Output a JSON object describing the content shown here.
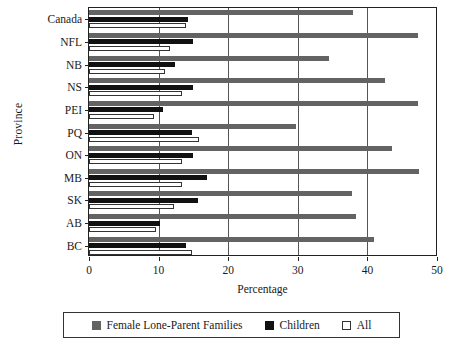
{
  "chart_data": {
    "type": "bar",
    "orientation": "horizontal",
    "title": "",
    "xlabel": "Percentage",
    "ylabel": "Province",
    "xlim": [
      0,
      50
    ],
    "xticks": [
      0,
      10,
      20,
      30,
      40,
      50
    ],
    "xticklabels": [
      "0",
      "10",
      "20",
      "30",
      "40",
      "50"
    ],
    "grid": true,
    "grid_axis": "x",
    "legend_position": "below",
    "categories": [
      "Canada",
      "NFL",
      "NB",
      "NS",
      "PEI",
      "PQ",
      "ON",
      "MB",
      "SK",
      "AB",
      "BC"
    ],
    "series": [
      {
        "name": "Female Lone-Parent Families",
        "color": "#636363",
        "values": [
          38.0,
          47.3,
          34.5,
          42.5,
          47.3,
          29.8,
          43.5,
          47.4,
          37.8,
          38.4,
          41.0
        ]
      },
      {
        "name": "Children",
        "color": "#111111",
        "values": [
          14.2,
          15.0,
          12.3,
          15.0,
          10.6,
          14.8,
          14.9,
          17.0,
          15.6,
          10.2,
          14.0
        ]
      },
      {
        "name": "All",
        "color": "#ffffff",
        "values": [
          13.9,
          11.6,
          10.9,
          13.4,
          9.3,
          15.8,
          13.4,
          13.3,
          12.2,
          9.6,
          14.8
        ]
      }
    ]
  },
  "legend": {
    "items": [
      {
        "label": "Female Lone-Parent Families",
        "swatch": "legend-swatch-gray"
      },
      {
        "label": "Children",
        "swatch": "legend-swatch-black"
      },
      {
        "label": "All",
        "swatch": "legend-swatch-white"
      }
    ]
  }
}
